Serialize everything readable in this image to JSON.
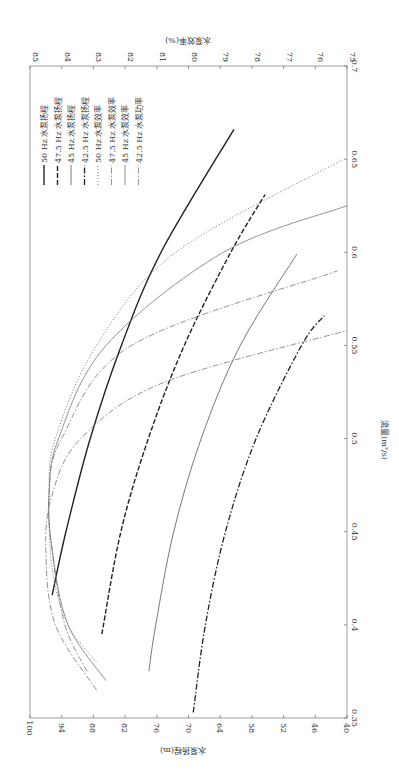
{
  "chart_data": {
    "type": "line",
    "orientation": "rotated-90-clockwise",
    "title": "",
    "xlabel": "流量(m³/s)",
    "ylabel_left": "水泵扬程(m)",
    "ylabel_right": "水泵效率(%)",
    "xlim": [
      0.35,
      0.7
    ],
    "ylim_left": [
      40,
      100
    ],
    "ylim_right": [
      75,
      85
    ],
    "x_ticks": [
      "0.35",
      "0.4",
      "0.45",
      "0.5",
      "0.55",
      "0.6",
      "0.65",
      "0.7"
    ],
    "y_left_ticks": [
      "40",
      "46",
      "52",
      "58",
      "64",
      "70",
      "76",
      "82",
      "88",
      "94",
      "100"
    ],
    "y_right_ticks": [
      "75",
      "76",
      "77",
      "78",
      "79",
      "80",
      "81",
      "82",
      "83",
      "84",
      "85"
    ],
    "grid": false,
    "legend_position": "upper-left (in rotated view)",
    "series": [
      {
        "name": "50 Hz 水泵扬程",
        "axis": "left",
        "style": "solid-thick",
        "color": "#222222",
        "x": [
          0.416,
          0.45,
          0.5,
          0.55,
          0.6,
          0.666
        ],
        "values": [
          95.8,
          93.2,
          88.6,
          82.7,
          75.2,
          61.4
        ]
      },
      {
        "name": "47.5 Hz 水泵扬程",
        "axis": "left",
        "style": "dashed-thick",
        "color": "#222222",
        "x": [
          0.395,
          0.45,
          0.5,
          0.55,
          0.6,
          0.631
        ],
        "values": [
          86.4,
          82.8,
          77.6,
          70.8,
          62.0,
          55.5
        ]
      },
      {
        "name": "45 Hz 水泵扬程",
        "axis": "left",
        "style": "solid-thin",
        "color": "#555555",
        "x": [
          0.375,
          0.4,
          0.45,
          0.5,
          0.55,
          0.599
        ],
        "values": [
          77.5,
          76.2,
          72.8,
          67.6,
          60.2,
          49.5
        ]
      },
      {
        "name": "42.5 Hz 水泵扬程",
        "axis": "left",
        "style": "dashdot-thick",
        "color": "#222222",
        "x": [
          0.353,
          0.4,
          0.45,
          0.5,
          0.55,
          0.566
        ],
        "values": [
          69.1,
          66.8,
          63.0,
          57.2,
          48.6,
          44.3
        ]
      },
      {
        "name": "50 Hz 水泵效率",
        "axis": "right",
        "style": "dotted",
        "color": "#777777",
        "x": [
          0.38,
          0.4,
          0.43,
          0.47,
          0.5,
          0.55,
          0.6,
          0.65
        ],
        "values": [
          82.9,
          83.8,
          84.3,
          84.4,
          84.2,
          82.9,
          80.4,
          75.1
        ]
      },
      {
        "name": "47.5 Hz 水泵效率",
        "axis": "right",
        "style": "dashdot-thin",
        "color": "#777777",
        "x": [
          0.375,
          0.4,
          0.44,
          0.47,
          0.5,
          0.55,
          0.59
        ],
        "values": [
          83.2,
          83.9,
          84.3,
          84.4,
          84.0,
          81.8,
          75.3
        ]
      },
      {
        "name": "45 Hz 水泵效率",
        "axis": "right",
        "style": "solid-thin",
        "color": "#777777",
        "x": [
          0.37,
          0.4,
          0.44,
          0.47,
          0.5,
          0.55,
          0.6,
          0.625
        ],
        "values": [
          82.6,
          83.8,
          84.3,
          84.4,
          84.1,
          82.6,
          78.9,
          75.0
        ]
      },
      {
        "name": "42.5 Hz 水泵功率",
        "axis": "right",
        "style": "dashdot-thin",
        "color": "#777777",
        "x": [
          0.365,
          0.4,
          0.44,
          0.47,
          0.5,
          0.53,
          0.558
        ],
        "values": [
          82.9,
          84.2,
          84.5,
          84.3,
          83.4,
          80.8,
          75.0
        ]
      }
    ]
  },
  "axes": {
    "x_title": "流量(m³/s)",
    "left_title": "水泵扬程(m)",
    "right_title": "水泵效率(%)"
  }
}
